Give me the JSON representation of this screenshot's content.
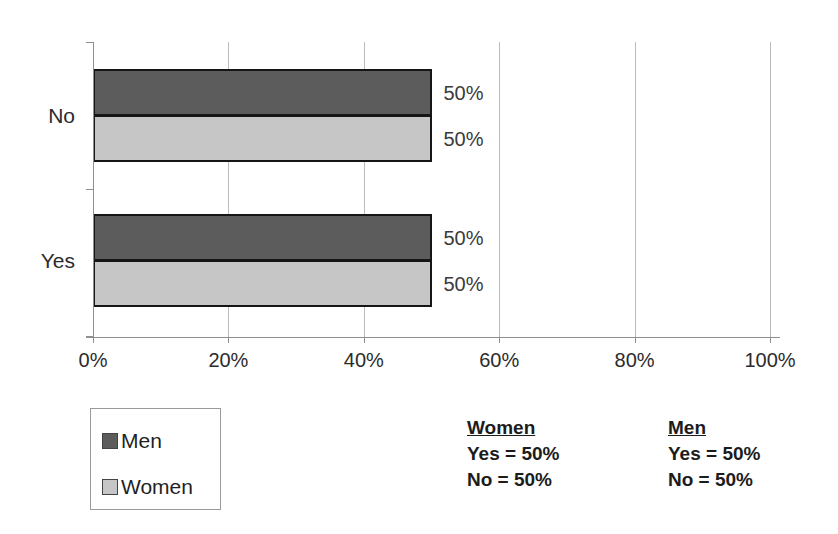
{
  "chart_data": {
    "type": "bar",
    "orientation": "horizontal",
    "title": "",
    "categories": [
      "No",
      "Yes"
    ],
    "series": [
      {
        "name": "Men",
        "color": "#5c5c5c",
        "values": [
          50,
          50
        ],
        "data_labels": [
          "50%",
          "50%"
        ]
      },
      {
        "name": "Women",
        "color": "#c6c6c6",
        "values": [
          50,
          50
        ],
        "data_labels": [
          "50%",
          "50%"
        ]
      }
    ],
    "x_ticks": [
      "0%",
      "20%",
      "40%",
      "60%",
      "80%",
      "100%"
    ],
    "xlim": [
      0,
      100
    ],
    "grid": "vertical-gridlines-at-major-ticks",
    "legend_position": "bottom-left"
  },
  "legend": {
    "items": [
      {
        "label": "Men",
        "color": "#5c5c5c"
      },
      {
        "label": "Women",
        "color": "#c6c6c6"
      }
    ]
  },
  "summaries": [
    {
      "title": "Women",
      "lines": [
        "Yes = 50%",
        "No = 50%"
      ]
    },
    {
      "title": "Men",
      "lines": [
        "Yes = 50%",
        "No = 50%"
      ]
    }
  ],
  "colors": {
    "bar_border": "#161616",
    "gridline": "#bcbcbc",
    "axis": "#8f8f8f",
    "background": "#ffffff",
    "text": "#2b2b2b"
  }
}
